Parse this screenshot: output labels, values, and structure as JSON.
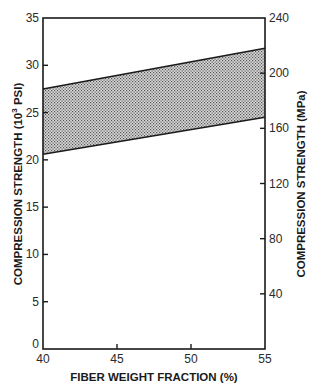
{
  "chart_data": {
    "type": "area",
    "title": "",
    "xlabel": "FIBER WEIGHT FRACTION (%)",
    "ylabel": "COMPRESSION STRENGTH (10",
    "ylabel_sup": "3",
    "ylabel_tail": " PSI)",
    "y2label": "COMPRESSION STRENGTH (MPa)",
    "xlim": [
      40,
      55
    ],
    "ylim": [
      0,
      35
    ],
    "y2lim": [
      0,
      240
    ],
    "x_ticks": [
      40,
      45,
      50,
      55
    ],
    "y_ticks": [
      0,
      5,
      10,
      15,
      20,
      25,
      30,
      35
    ],
    "y2_ticks": [
      40,
      80,
      120,
      160,
      200,
      240
    ],
    "grid": false,
    "legend": null,
    "series": [
      {
        "name": "upper bound",
        "x": [
          40,
          55
        ],
        "values": [
          27.5,
          31.8
        ]
      },
      {
        "name": "lower bound",
        "x": [
          40,
          55
        ],
        "values": [
          20.6,
          24.5
        ]
      }
    ],
    "fill_between": {
      "upper": "upper bound",
      "lower": "lower bound",
      "pattern": "stipple"
    }
  },
  "labels": {
    "x_ticks": [
      "40",
      "45",
      "50",
      "55"
    ],
    "y_ticks": [
      "0",
      "5",
      "10",
      "15",
      "20",
      "25",
      "30",
      "35"
    ],
    "y2_ticks": [
      "40",
      "80",
      "120",
      "160",
      "200",
      "240"
    ]
  }
}
